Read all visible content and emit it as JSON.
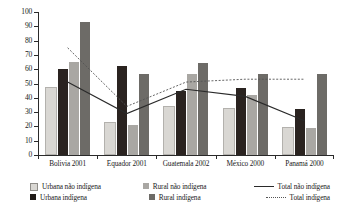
{
  "chart_data": {
    "type": "bar",
    "title": "",
    "subtitle": "",
    "xlabel": "",
    "ylabel": "",
    "ylim": [
      0,
      100
    ],
    "ytick_step": 10,
    "yticks": [
      100,
      90,
      80,
      70,
      60,
      50,
      40,
      30,
      20,
      10,
      0
    ],
    "grid": false,
    "legend_position": "bottom",
    "categories": [
      "Bolivia 2001",
      "Equador 2001",
      "Guatemala 2002",
      "México 2000",
      "Panamá 2000"
    ],
    "series": [
      {
        "name": "Urbana não indígena",
        "type": "bar",
        "color": "#d9d7d3",
        "values": [
          46,
          22,
          33,
          31.5,
          18
        ]
      },
      {
        "name": "Urbana indígena",
        "type": "bar",
        "color": "#2a2320",
        "values": [
          60.5,
          62,
          45,
          47,
          32
        ]
      },
      {
        "name": "Rural não indígena",
        "type": "bar",
        "color": "#a9a7a3",
        "values": [
          65,
          21,
          57,
          42,
          19
        ]
      },
      {
        "name": "Rural indígena",
        "type": "bar",
        "color": "#6d6b67",
        "values": [
          93,
          56.5,
          64,
          57,
          57
        ]
      },
      {
        "name": "Total não indígena",
        "type": "line",
        "color": "#2a2a2a",
        "style": "solid",
        "values": [
          51,
          29,
          46,
          41,
          24
        ]
      },
      {
        "name": "Total indígena",
        "type": "line",
        "color": "#555555",
        "style": "dotted",
        "values": [
          75,
          34,
          51,
          53,
          53
        ]
      }
    ]
  },
  "axis": {
    "y_tick_labels": [
      "100",
      "90",
      "80",
      "70",
      "60",
      "50",
      "40",
      "30",
      "20",
      "10",
      "0"
    ]
  },
  "legend": {
    "items": [
      {
        "label": "Urbana não indígena",
        "marker": "square-light-gray-icon"
      },
      {
        "label": "Rural não indígena",
        "marker": "square-medium-gray-icon"
      },
      {
        "label": "Total não indígena",
        "marker": "solid-line-icon"
      },
      {
        "label": "Urbana indígena",
        "marker": "square-black-icon"
      },
      {
        "label": "Rural indígena",
        "marker": "square-dark-gray-icon"
      },
      {
        "label": "Total indígena",
        "marker": "dotted-line-icon"
      }
    ]
  }
}
